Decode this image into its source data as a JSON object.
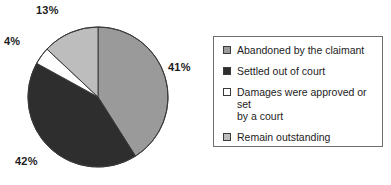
{
  "chart_data": {
    "type": "pie",
    "title": "",
    "subtitle": "",
    "xlabel": "",
    "ylabel": "",
    "grid": false,
    "legend_position": "right",
    "start_angle_deg": 0,
    "direction": "clockwise",
    "categories": [
      "Abandoned by the claimant",
      "Settled out of court",
      "Damages were approved or set by a court",
      "Remain outstanding"
    ],
    "values": [
      41,
      42,
      4,
      13
    ],
    "value_unit": "%",
    "data_labels": [
      "41%",
      "42%",
      "4%",
      "13%"
    ],
    "colors": [
      "#9a9a9a",
      "#2e2e2e",
      "#ffffff",
      "#bdbdbd"
    ],
    "slices": [
      {
        "label": "Abandoned by the claimant",
        "value": 41,
        "data_label": "41%",
        "color": "#9a9a9a",
        "start_deg": 0,
        "end_deg": 147.6
      },
      {
        "label": "Settled out of court",
        "value": 42,
        "data_label": "42%",
        "color": "#2e2e2e",
        "start_deg": 147.6,
        "end_deg": 298.8
      },
      {
        "label": "Damages were approved or set by a court",
        "value": 4,
        "data_label": "4%",
        "color": "#ffffff",
        "start_deg": 298.8,
        "end_deg": 313.2
      },
      {
        "label": "Remain outstanding",
        "value": 13,
        "data_label": "13%",
        "color": "#bdbdbd",
        "start_deg": 313.2,
        "end_deg": 360
      }
    ]
  },
  "pie": {
    "labels": {
      "slice_41": "41%",
      "slice_42": "42%",
      "slice_4": "4%",
      "slice_13": "13%"
    }
  },
  "legend": {
    "items": [
      {
        "label": "Abandoned by the claimant",
        "swatch_color": "#9a9a9a",
        "swatch_name": "legend-swatch-abandoned"
      },
      {
        "label": "Settled out of court",
        "swatch_color": "#2e2e2e",
        "swatch_name": "legend-swatch-settled"
      },
      {
        "label": "Damages were approved or set\nby a court",
        "swatch_color": "#ffffff",
        "swatch_name": "legend-swatch-damages"
      },
      {
        "label": "Remain outstanding",
        "swatch_color": "#bdbdbd",
        "swatch_name": "legend-swatch-outstanding"
      }
    ],
    "border_color": "#6e6e6e"
  }
}
